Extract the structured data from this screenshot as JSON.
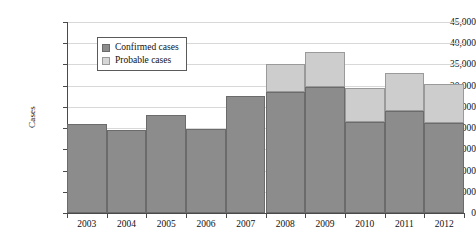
{
  "chart_data": {
    "type": "bar",
    "title": "",
    "subtitle": "",
    "xlabel": "",
    "ylabel": "Cases",
    "stacked": true,
    "grid": true,
    "legend_position": "inside-top-left",
    "ylim": [
      0,
      45000
    ],
    "ytick_step": 5000,
    "ytick_labels": [
      "0",
      "5,000",
      "10,000",
      "15,000",
      "20,000",
      "25,000",
      "30,000",
      "35,000",
      "40,000",
      "45,000"
    ],
    "ytick_values": [
      0,
      5000,
      10000,
      15000,
      20000,
      25000,
      30000,
      35000,
      40000,
      45000
    ],
    "categories": [
      "2003",
      "2004",
      "2005",
      "2006",
      "2007",
      "2008",
      "2009",
      "2010",
      "2011",
      "2012"
    ],
    "series": [
      {
        "name": "Confirmed cases",
        "color": "#8c8c8c",
        "values": [
          21000,
          19500,
          23000,
          19800,
          27500,
          28500,
          29800,
          21500,
          24000,
          21300
        ]
      },
      {
        "name": "Probable cases",
        "color": "#cdcdcd",
        "values": [
          0,
          0,
          0,
          0,
          0,
          6500,
          8200,
          8000,
          9000,
          9200
        ]
      }
    ],
    "totals": [
      21000,
      19500,
      23000,
      19800,
      27500,
      35000,
      38000,
      29500,
      33000,
      30500
    ]
  },
  "legend": {
    "items": [
      {
        "label": "Confirmed cases",
        "swatch": "confirmed"
      },
      {
        "label": "Probable cases",
        "swatch": "probable"
      }
    ]
  },
  "axes": {
    "y_title": "Cases"
  }
}
